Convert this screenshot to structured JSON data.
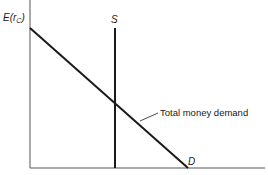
{
  "diagram": {
    "type": "supply-demand",
    "y_axis_label": "E(r",
    "y_axis_label_sub": "C",
    "y_axis_label_close": ")",
    "supply_label": "S",
    "demand_label": "D",
    "demand_curve_label": "Total money demand"
  },
  "colors": {
    "line": "#1a1a1a",
    "axis": "#555555"
  }
}
